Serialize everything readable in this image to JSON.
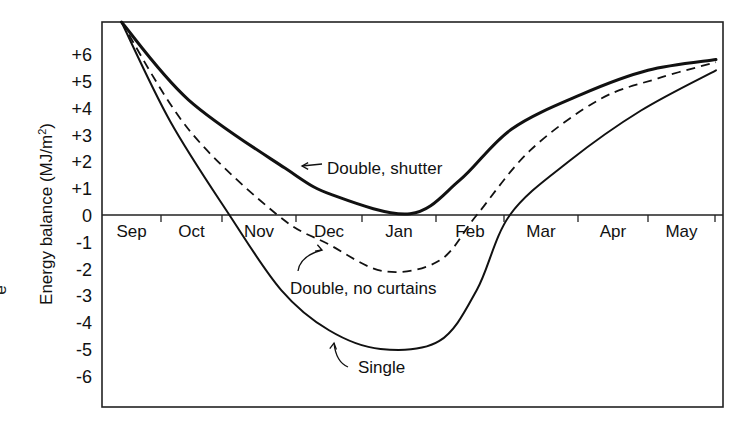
{
  "chart_data": {
    "type": "line",
    "title": "",
    "xlabel": "",
    "ylabel": "Energy balance (MJ/m²)",
    "ylim": [
      -7.1,
      7.2
    ],
    "yticks": [
      "+6",
      "+5",
      "+4",
      "+3",
      "+2",
      "+1",
      "0",
      "-1",
      "-2",
      "-3",
      "-4",
      "-5",
      "-6"
    ],
    "ytick_values": [
      6,
      5,
      4,
      3,
      2,
      1,
      0,
      -1,
      -2,
      -3,
      -4,
      -5,
      -6
    ],
    "categories": [
      "Sep",
      "Oct",
      "Nov",
      "Dec",
      "Jan",
      "Feb",
      "Mar",
      "Apr",
      "May"
    ],
    "grid": false,
    "legend": "inline annotations",
    "x_months_position": [
      0.33,
      1.0,
      1.75,
      2.55,
      3.5,
      4.3,
      5.0,
      6.0,
      7.0,
      8.0,
      9.12
    ],
    "series": [
      {
        "name": "Double, shutter",
        "style": "solid-thick",
        "points": [
          [
            0.33,
            7.2
          ],
          [
            1.45,
            4.3
          ],
          [
            2.85,
            1.75
          ],
          [
            3.55,
            0.75
          ],
          [
            4.65,
            0.05
          ],
          [
            5.35,
            1.3
          ],
          [
            6.1,
            3.2
          ],
          [
            7.05,
            4.5
          ],
          [
            8.0,
            5.4
          ],
          [
            9.12,
            5.8
          ]
        ]
      },
      {
        "name": "Double, no curtains",
        "style": "dashed",
        "points": [
          [
            0.33,
            7.2
          ],
          [
            1.45,
            3.2
          ],
          [
            2.75,
            0.0
          ],
          [
            3.5,
            -1.1
          ],
          [
            4.3,
            -2.1
          ],
          [
            5.05,
            -1.7
          ],
          [
            5.6,
            0.0
          ],
          [
            6.35,
            2.4
          ],
          [
            7.3,
            4.3
          ],
          [
            8.15,
            5.1
          ],
          [
            9.12,
            5.7
          ]
        ]
      },
      {
        "name": "Single",
        "style": "solid",
        "points": [
          [
            0.33,
            7.2
          ],
          [
            1.15,
            3.5
          ],
          [
            2.1,
            0.0
          ],
          [
            2.8,
            -2.8
          ],
          [
            3.5,
            -4.3
          ],
          [
            4.25,
            -5.0
          ],
          [
            5.05,
            -4.7
          ],
          [
            5.6,
            -2.8
          ],
          [
            6.08,
            0.0
          ],
          [
            6.9,
            2.05
          ],
          [
            7.9,
            3.9
          ],
          [
            9.12,
            5.4
          ]
        ]
      }
    ],
    "annotations": [
      {
        "text": "Double, shutter",
        "arrow_to": "Double, shutter"
      },
      {
        "text": "Double, no curtains",
        "arrow_to": "Double, no curtains"
      },
      {
        "text": "Single",
        "arrow_to": "Single"
      }
    ]
  },
  "labels": {
    "ylabel": "Energy balance (MJ/m²)",
    "ylabel_main": "Energy balance (MJ/m",
    "ylabel_sup": "2",
    "ylabel_end": ")",
    "left_fragment": "e",
    "ann_shutter": "Double, shutter",
    "ann_nocurtains": "Double, no curtains",
    "ann_single": "Single"
  }
}
